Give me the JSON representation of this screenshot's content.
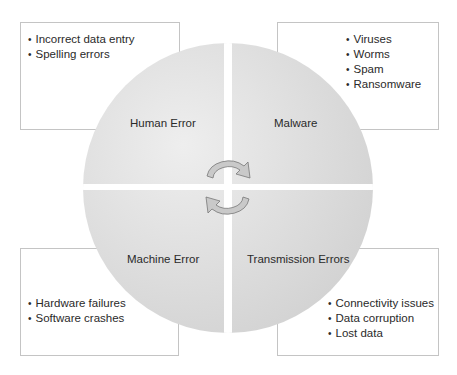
{
  "diagram": {
    "type": "four-quadrant circle with cycle arrows",
    "colors": {
      "circle_fill_light": "#e9e9e9",
      "circle_fill_dark": "#cfcfcf",
      "box_border": "#c4c4c4",
      "arrow_fill": "#c8c8c8",
      "arrow_stroke": "#7a7a7a",
      "text": "#2a2a2a"
    },
    "quadrants": [
      {
        "position": "top-left",
        "label": "Human Error",
        "items": [
          "Incorrect data entry",
          "Spelling errors"
        ]
      },
      {
        "position": "top-right",
        "label": "Malware",
        "items": [
          "Viruses",
          "Worms",
          "Spam",
          "Ransomware"
        ]
      },
      {
        "position": "bottom-left",
        "label": "Machine Error",
        "items": [
          "Hardware failures",
          "Software crashes"
        ]
      },
      {
        "position": "bottom-right",
        "label": "Transmission Errors",
        "items": [
          "Connectivity issues",
          "Data corruption",
          "Lost data"
        ]
      }
    ],
    "center_icon": "cycle-arrows-icon"
  }
}
